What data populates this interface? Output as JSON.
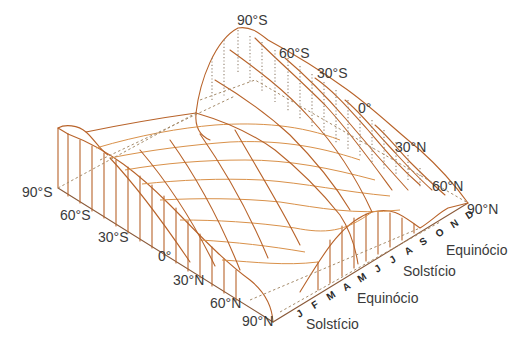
{
  "diagram": {
    "type": "3d-wireframe-surface",
    "colors": {
      "mesh_line": "#b8632a",
      "mesh_light": "#d9914a",
      "hidden_line": "#a58b6a",
      "label_text": "#3a3a3a",
      "background": "#ffffff"
    },
    "back_axis": {
      "labels": [
        "90°S",
        "60°S",
        "30°S",
        "0°",
        "30°N",
        "60°N",
        "90°N"
      ]
    },
    "front_axis": {
      "labels": [
        "90°S",
        "60°S",
        "30°S",
        "0°",
        "30°N",
        "60°N",
        "90°N"
      ]
    },
    "month_axis": {
      "labels": [
        "J",
        "F",
        "M",
        "A",
        "M",
        "J",
        "J",
        "A",
        "S",
        "O",
        "N",
        "D"
      ]
    },
    "season_markers": [
      {
        "label": "Solstício"
      },
      {
        "label": "Equinócio"
      },
      {
        "label": "Solstício"
      },
      {
        "label": "Equinócio"
      }
    ]
  }
}
